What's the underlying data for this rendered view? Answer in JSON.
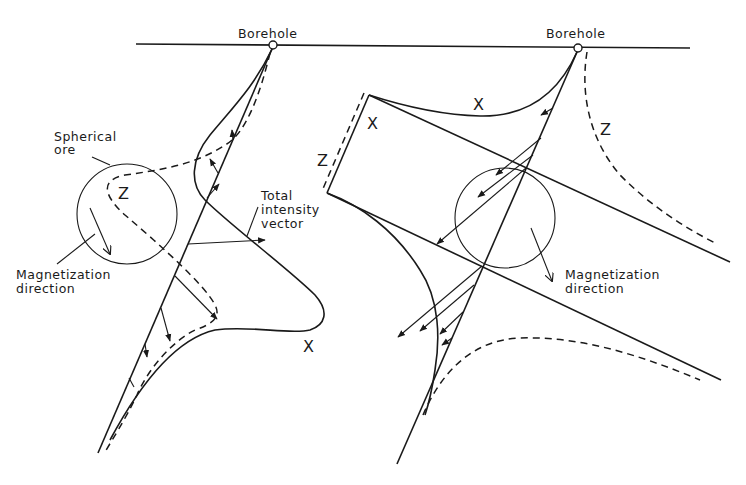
{
  "diagram": {
    "left_panel": {
      "borehole_label": "Borehole",
      "ore_label_line1": "Spherical",
      "ore_label_line2": "ore",
      "z_curve_label": "Z",
      "x_curve_label": "X",
      "vector_label_line1": "Total",
      "vector_label_line2": "intensity",
      "vector_label_line3": "vector",
      "magnetization_label_line1": "Magnetization",
      "magnetization_label_line2": "direction"
    },
    "right_panel": {
      "borehole_label": "Borehole",
      "x_curve_label": "X",
      "x_profile_label": "X",
      "z_profile_label": "Z",
      "z_curve_label": "Z",
      "magnetization_label_line1": "Magnetization",
      "magnetization_label_line2": "direction"
    },
    "colors": {
      "line": "#1a1a1a",
      "background": "#ffffff"
    }
  }
}
